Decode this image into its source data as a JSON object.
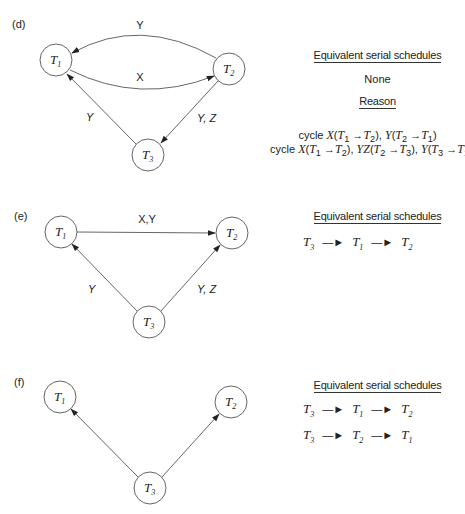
{
  "panels": [
    {
      "id": "d",
      "label": "(d)",
      "nodes": [
        {
          "id": "T1",
          "label": "T",
          "sub": "1",
          "cx": 56,
          "cy": 60
        },
        {
          "id": "T2",
          "label": "T",
          "sub": "2",
          "cx": 229,
          "cy": 69
        },
        {
          "id": "T3",
          "label": "T",
          "sub": "3",
          "cx": 148,
          "cy": 155
        }
      ],
      "edges": [
        {
          "from": "T2",
          "to": "T1",
          "label": "Y",
          "curved": "up"
        },
        {
          "from": "T1",
          "to": "T2",
          "label": "X",
          "curved": "down"
        },
        {
          "from": "T3",
          "to": "T1",
          "label": "Y"
        },
        {
          "from": "T2",
          "to": "T3",
          "label": "Y, Z"
        }
      ],
      "side": {
        "heading": "Equivalent serial schedules",
        "schedules_text": "None",
        "reason_heading": "Reason",
        "reasons": [
          "cycle X(T1 → T2), Y(T2 → T1)",
          "cycle X(T1 → T2), YZ(T2 → T3), Y(T3 → T1)"
        ]
      }
    },
    {
      "id": "e",
      "label": "(e)",
      "nodes": [
        {
          "id": "T1",
          "label": "T",
          "sub": "1",
          "cx": 61,
          "cy": 232
        },
        {
          "id": "T2",
          "label": "T",
          "sub": "2",
          "cx": 232,
          "cy": 233
        },
        {
          "id": "T3",
          "label": "T",
          "sub": "3",
          "cx": 149,
          "cy": 322
        }
      ],
      "edges": [
        {
          "from": "T1",
          "to": "T2",
          "label": "X,Y"
        },
        {
          "from": "T3",
          "to": "T1",
          "label": "Y"
        },
        {
          "from": "T3",
          "to": "T2",
          "label": "Y, Z"
        }
      ],
      "side": {
        "heading": "Equivalent serial schedules",
        "schedules": [
          [
            "T3",
            "T1",
            "T2"
          ]
        ]
      }
    },
    {
      "id": "f",
      "label": "(f)",
      "nodes": [
        {
          "id": "T1",
          "label": "T",
          "sub": "1",
          "cx": 60,
          "cy": 397
        },
        {
          "id": "T2",
          "label": "T",
          "sub": "2",
          "cx": 231,
          "cy": 402
        },
        {
          "id": "T3",
          "label": "T",
          "sub": "3",
          "cx": 150,
          "cy": 488
        }
      ],
      "edges": [
        {
          "from": "T3",
          "to": "T1",
          "label": ""
        },
        {
          "from": "T3",
          "to": "T2",
          "label": ""
        }
      ],
      "side": {
        "heading": "Equivalent serial schedules",
        "schedules": [
          [
            "T3",
            "T1",
            "T2"
          ],
          [
            "T3",
            "T2",
            "T1"
          ]
        ]
      }
    }
  ],
  "symbols": {
    "arrow": "→",
    "schedule_arrow": "—►"
  },
  "colors": {
    "stroke": "#555555",
    "text": "#222222"
  }
}
